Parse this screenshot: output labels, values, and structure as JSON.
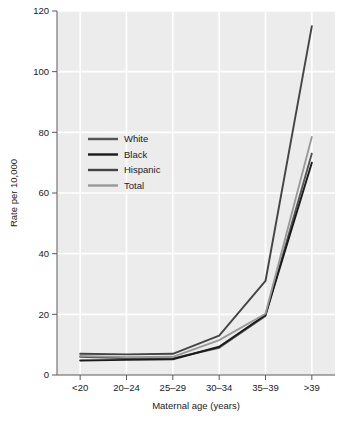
{
  "chart_data": {
    "type": "line",
    "title": "",
    "xlabel": "Maternal age (years)",
    "ylabel": "Rate per 10,000",
    "categories": [
      "<20",
      "20–24",
      "25–29",
      "30–34",
      "35–39",
      ">39"
    ],
    "ylim": [
      0,
      120
    ],
    "yticks": [
      0,
      20,
      40,
      60,
      80,
      100,
      120
    ],
    "ytick_labels": [
      "0",
      "20",
      "40",
      "60",
      "80",
      "100",
      "120"
    ],
    "grid": true,
    "legend_position": "upper-left-inside",
    "series": [
      {
        "name": "White",
        "color": "#555555",
        "values": [
          6.0,
          5.5,
          5.5,
          9.0,
          19.5,
          73.0
        ]
      },
      {
        "name": "Black",
        "color": "#1a1a1a",
        "values": [
          4.8,
          5.0,
          5.2,
          9.3,
          19.8,
          70.0
        ]
      },
      {
        "name": "Hispanic",
        "color": "#444444",
        "values": [
          7.0,
          6.8,
          7.0,
          13.0,
          31.0,
          115.0
        ]
      },
      {
        "name": "Total",
        "color": "#999999",
        "values": [
          6.3,
          5.9,
          6.0,
          11.5,
          20.2,
          78.5
        ]
      }
    ]
  },
  "style": {
    "plot_background": "#ececec",
    "gridline_color": "#ffffff",
    "axis_color": "#5a5a5a",
    "page_background": "#ffffff"
  },
  "legend": {
    "items": [
      {
        "label": "White"
      },
      {
        "label": "Black"
      },
      {
        "label": "Hispanic"
      },
      {
        "label": "Total"
      }
    ]
  }
}
